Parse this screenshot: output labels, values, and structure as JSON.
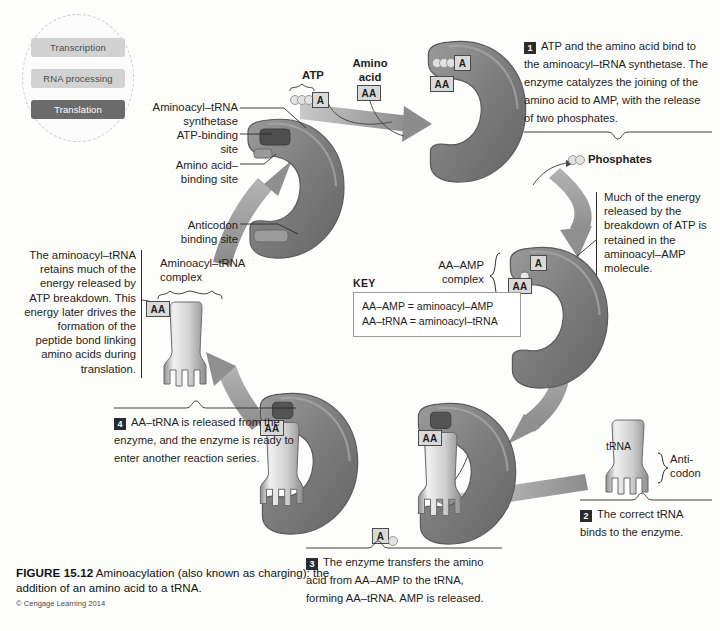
{
  "figure": {
    "number": "FIGURE 15.12",
    "title": "Aminoacylation (also known as charging): the addition of an amino acid to a tRNA.",
    "credit": "© Cengage Learning 2014"
  },
  "locator": {
    "name": "pathway-locator",
    "items": [
      {
        "label": "Transcription",
        "active": false
      },
      {
        "label": "RNA processing",
        "active": false
      },
      {
        "label": "Translation",
        "active": true
      }
    ],
    "active_color": "#6b6b6b",
    "inactive_color": "#d2d2d2"
  },
  "labels": {
    "synthetase": "Aminoacyl–tRNA\nsynthetase",
    "atp_binding_site": "ATP-binding\nsite",
    "amino_acid_binding_site": "Amino acid–\nbinding site",
    "anticodon_binding_site": "Anticodon\nbinding site",
    "atp": "ATP",
    "amino_acid": "Amino\nacid",
    "phosphates": "Phosphates",
    "aa_amp_complex": "AA–AMP\ncomplex",
    "aminoacyl_trna_complex": "Aminoacyl–tRNA\ncomplex",
    "trna": "tRNA",
    "anticodon": "Anti-\ncodon"
  },
  "notes": {
    "energy_retained": "Much of the energy released by the breakdown of ATP is retained in the aminoacyl–AMP molecule.",
    "energy_drives": "The aminoacyl–tRNA retains much of the energy released by ATP breakdown. This energy later drives the formation of the peptide bond linking amino acids during translation."
  },
  "key": {
    "title": "KEY",
    "lines": [
      "AA–AMP = aminoacyl–AMP",
      "AA–tRNA = aminoacyl–tRNA"
    ]
  },
  "steps": [
    {
      "number": "1",
      "text": "ATP and the amino acid bind to the aminoacyl–tRNA synthetase. The enzyme catalyzes the joining of the amino acid to AMP, with the release of two phosphates."
    },
    {
      "number": "2",
      "text": "The correct tRNA binds to the enzyme."
    },
    {
      "number": "3",
      "text": "The enzyme transfers the amino acid from AA–AMP to the tRNA, forming AA–tRNA. AMP is released."
    },
    {
      "number": "4",
      "text": "AA–tRNA is released from the enzyme, and the enzyme is ready to enter another reaction series."
    }
  ],
  "molecules": {
    "aa_tag": "AA",
    "a_tag": "A"
  },
  "colors": {
    "enzyme_fill": "#7b7b7b",
    "enzyme_edge": "#5e5e5e",
    "arrow": "#8f8f8f",
    "tag_fill": "#d9d9d9",
    "ink": "#1d1d1b"
  }
}
